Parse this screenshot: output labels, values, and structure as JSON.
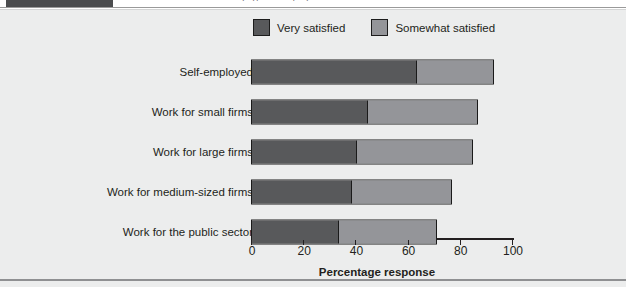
{
  "header": {
    "tab_block": "",
    "clipped_caption": "satisfaction by type of employer"
  },
  "chart_data": {
    "type": "bar",
    "orientation": "horizontal",
    "stacked": true,
    "title": "",
    "xlabel": "Percentage response",
    "ylabel": "",
    "xlim": [
      0,
      100
    ],
    "xticks": [
      0,
      20,
      40,
      60,
      80,
      100
    ],
    "grid": false,
    "legend_position": "top-center",
    "categories": [
      "Self-employed",
      "Work for small firms",
      "Work for large firms",
      "Work for medium-sized firms",
      "Work for the public sector"
    ],
    "series": [
      {
        "name": "Very satisfied",
        "color": "#58595b",
        "values": [
          63,
          44,
          40,
          38,
          33
        ]
      },
      {
        "name": "Somewhat satisfied",
        "color": "#949599",
        "values": [
          29,
          42,
          44,
          38,
          37
        ]
      }
    ],
    "totals": [
      92,
      86,
      84,
      76,
      70
    ]
  },
  "colors": {
    "panel_background": "#eceded",
    "very_satisfied": "#58595b",
    "somewhat_satisfied": "#949599",
    "outline": "#1a1a1a",
    "text": "#231f20",
    "header_tab": "#4b4c4e",
    "bottom_rule": "#8f9092"
  }
}
